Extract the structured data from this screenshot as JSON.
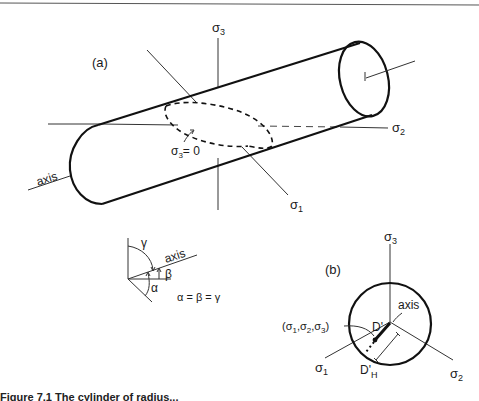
{
  "figure": {
    "panel_a": {
      "label": "(a)",
      "sigma1": "σ",
      "sigma1_sub": "1",
      "sigma2": "σ",
      "sigma2_sub": "2",
      "sigma3": "σ",
      "sigma3_sub": "3",
      "plane_label": "σ",
      "plane_label_sub": "3",
      "plane_label_eq": "= 0",
      "axis_label": "axis"
    },
    "angle_inset": {
      "gamma": "γ",
      "beta": "β",
      "alpha": "α",
      "axis_label": "axis",
      "equation": "α = β = γ"
    },
    "panel_b": {
      "label": "(b)",
      "sigma1": "σ",
      "sigma1_sub": "1",
      "sigma2": "σ",
      "sigma2_sub": "2",
      "sigma3": "σ",
      "sigma3_sub": "3",
      "axis_label": "axis",
      "point_label": "(σ1,σ2,σ3)",
      "d_prime": "D'",
      "d_prime_h": "D'",
      "d_prime_h_sub": "H"
    },
    "caption": "Figure 7.1  The cylinder of radius..."
  },
  "colors": {
    "stroke": "#111111",
    "thin": "#333333",
    "background": "#ffffff"
  }
}
